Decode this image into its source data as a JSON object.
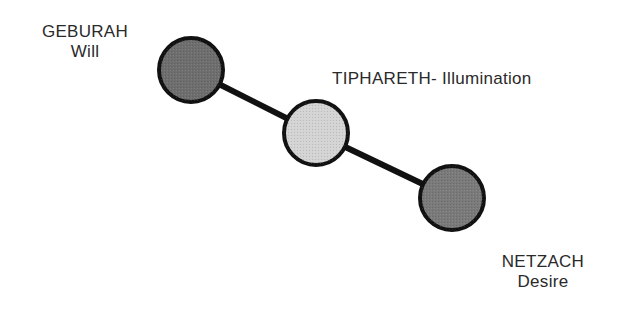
{
  "diagram": {
    "type": "sephirot-path",
    "nodes": [
      {
        "id": "geburah",
        "name": "GEBURAH",
        "subtitle": "Will",
        "cx": 191,
        "cy": 70,
        "r": 32,
        "fill": "#6e6e6e"
      },
      {
        "id": "tiphareth",
        "name": "TIPHARETH",
        "separator": "- ",
        "subtitle": "Illumination",
        "cx": 316,
        "cy": 133,
        "r": 32,
        "fill": "#d4d4d4"
      },
      {
        "id": "netzach",
        "name": "NETZACH",
        "subtitle": "Desire",
        "cx": 452,
        "cy": 198,
        "r": 32,
        "fill": "#7a7a7a"
      }
    ],
    "edges": [
      {
        "from": "geburah",
        "to": "tiphareth"
      },
      {
        "from": "tiphareth",
        "to": "netzach"
      }
    ],
    "colors": {
      "stroke": "#111111",
      "text": "#2a2a2a",
      "background": "#ffffff"
    }
  }
}
